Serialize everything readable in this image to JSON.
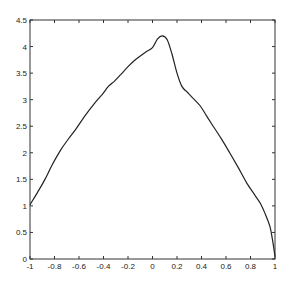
{
  "chart_data": {
    "type": "line",
    "title": "",
    "xlabel": "",
    "ylabel": "",
    "xlim": [
      -1,
      1
    ],
    "ylim": [
      0,
      4.5
    ],
    "grid": false,
    "legend": null,
    "xticks": [
      -1,
      -0.8,
      -0.6,
      -0.4,
      -0.2,
      0,
      0.2,
      0.4,
      0.6,
      0.8,
      1
    ],
    "xtick_labels": [
      "-1",
      "-0.8",
      "-0.6",
      "-0.4",
      "-0.2",
      "0",
      "0.2",
      "0.4",
      "0.6",
      "0.8",
      "1"
    ],
    "yticks": [
      0,
      0.5,
      1,
      1.5,
      2,
      2.5,
      3,
      3.5,
      4,
      4.5
    ],
    "ytick_labels": [
      "0",
      "0.5",
      "1",
      "1.5",
      "2",
      "2.5",
      "3",
      "3.5",
      "4",
      "4.5"
    ],
    "series": [
      {
        "name": "curve",
        "color": "#222222",
        "x": [
          -1.0,
          -0.94,
          -0.88,
          -0.82,
          -0.75,
          -0.69,
          -0.63,
          -0.55,
          -0.47,
          -0.41,
          -0.36,
          -0.31,
          -0.26,
          -0.2,
          -0.14,
          -0.06,
          0.0,
          0.04,
          0.08,
          0.12,
          0.16,
          0.2,
          0.24,
          0.28,
          0.33,
          0.39,
          0.44,
          0.49,
          0.56,
          0.63,
          0.7,
          0.77,
          0.83,
          0.88,
          0.92,
          0.96,
          0.98,
          1.0
        ],
        "y": [
          1.02,
          1.25,
          1.49,
          1.77,
          2.05,
          2.25,
          2.43,
          2.7,
          2.94,
          3.1,
          3.25,
          3.35,
          3.47,
          3.62,
          3.75,
          3.89,
          3.98,
          4.14,
          4.2,
          4.13,
          3.85,
          3.5,
          3.25,
          3.15,
          3.03,
          2.88,
          2.7,
          2.52,
          2.27,
          2.0,
          1.72,
          1.43,
          1.22,
          1.05,
          0.85,
          0.6,
          0.35,
          0.05
        ]
      }
    ]
  }
}
